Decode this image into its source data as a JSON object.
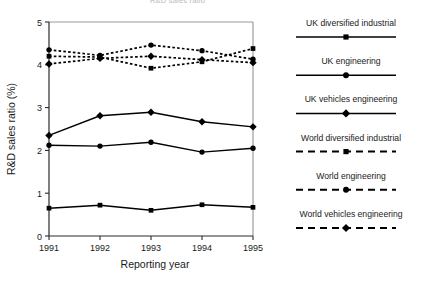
{
  "header": {
    "cropped_top_text": "R&D sales ratio"
  },
  "chart_data": {
    "type": "line",
    "title": "",
    "xlabel": "Reporting year",
    "ylabel": "R&D sales ratio (%)",
    "categories": [
      "1991",
      "1992",
      "1993",
      "1994",
      "1995"
    ],
    "x": [
      1991,
      1992,
      1993,
      1994,
      1995
    ],
    "xlim": [
      1991,
      1995
    ],
    "ylim": [
      0,
      5
    ],
    "yticks": [
      "0",
      "1",
      "2",
      "3",
      "4",
      "5"
    ],
    "ytick_values": [
      0,
      1,
      2,
      3,
      4,
      5
    ],
    "grid": false,
    "legend_position": "right",
    "series": [
      {
        "name": "UK diversified industrial",
        "marker": "square",
        "linestyle": "solid",
        "color": "#000000",
        "values": [
          0.65,
          0.72,
          0.6,
          0.73,
          0.67
        ]
      },
      {
        "name": "UK engineering",
        "marker": "circle",
        "linestyle": "solid",
        "color": "#000000",
        "values": [
          2.12,
          2.1,
          2.19,
          1.96,
          2.05
        ]
      },
      {
        "name": "UK vehicles engineering",
        "marker": "diamond",
        "linestyle": "solid",
        "color": "#000000",
        "values": [
          2.35,
          2.81,
          2.89,
          2.67,
          2.55
        ]
      },
      {
        "name": "World diversified industrial",
        "marker": "square",
        "linestyle": "dashed",
        "color": "#000000",
        "values": [
          4.2,
          4.18,
          3.92,
          4.07,
          4.38
        ]
      },
      {
        "name": "World engineering",
        "marker": "circle",
        "linestyle": "dashed",
        "color": "#000000",
        "values": [
          4.35,
          4.22,
          4.46,
          4.33,
          4.13
        ]
      },
      {
        "name": "World vehicles engineering",
        "marker": "diamond",
        "linestyle": "dashed",
        "color": "#000000",
        "values": [
          4.02,
          4.15,
          4.2,
          4.12,
          4.05
        ]
      }
    ]
  },
  "legend": {
    "items": [
      {
        "label": "UK diversified industrial",
        "marker": "square",
        "linestyle": "solid"
      },
      {
        "label": "UK engineering",
        "marker": "circle",
        "linestyle": "solid"
      },
      {
        "label": "UK vehicles engineering",
        "marker": "diamond",
        "linestyle": "solid"
      },
      {
        "label": "World diversified industrial",
        "marker": "square",
        "linestyle": "dashed"
      },
      {
        "label": "World engineering",
        "marker": "circle",
        "linestyle": "dashed"
      },
      {
        "label": "World vehicles engineering",
        "marker": "diamond",
        "linestyle": "dashed"
      }
    ]
  }
}
